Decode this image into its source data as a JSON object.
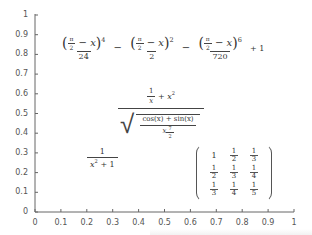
{
  "chart_data": {
    "type": "scatter",
    "title": "",
    "xlabel": "",
    "ylabel": "",
    "xlim": [
      0,
      1
    ],
    "ylim": [
      0,
      1
    ],
    "grid": false,
    "x_ticks": [
      "0",
      "0.1",
      "0.2",
      "0.3",
      "0.4",
      "0.5",
      "0.6",
      "0.7",
      "0.8",
      "0.9",
      "1"
    ],
    "y_ticks": [
      "0",
      "0.1",
      "0.2",
      "0.3",
      "0.4",
      "0.5",
      "0.6",
      "0.7",
      "0.8",
      "0.9",
      "1"
    ],
    "annotations": [
      {
        "id": "taylor_series",
        "text": "((π/2 − x)^4)/24 − ((π/2 − x)^2)/2 − ((π/2 − x)^6)/720 + 1",
        "x": 0.05,
        "y": 0.8
      },
      {
        "id": "sqrt_expression",
        "text": "(1/x + x^2) / sqrt((cos(x) + sin(x)) / x^(7/2))",
        "x": 0.45,
        "y": 0.55
      },
      {
        "id": "reciprocal",
        "text": "1/(x^2 + 1)",
        "x": 0.25,
        "y": 0.25
      },
      {
        "id": "hilbert_matrix",
        "text": "[[1, 1/2, 1/3], [1/2, 1/3, 1/4], [1/3, 1/4, 1/5]]",
        "x": 0.75,
        "y": 0.15
      }
    ]
  },
  "labels": {
    "taylor": {
      "pi": "π",
      "two": "2",
      "minus_x": "− x",
      "exp4": "4",
      "exp2": "2",
      "exp6": "6",
      "den1": "24",
      "den2": "2",
      "den3": "720",
      "op_minus": "−",
      "plus_one": "+ 1"
    },
    "sqrt_expr": {
      "one": "1",
      "x": "x",
      "plus_x2": "+ x",
      "sq": "2",
      "sqrt_sign": "√",
      "cos_sin": "cos(x) + sin(x)",
      "x_base": "x",
      "seven": "7",
      "two": "2"
    },
    "reciprocal": {
      "num": "1",
      "den_x": "x",
      "den_sq": "2",
      "den_plus": "+ 1"
    },
    "matrix": [
      [
        {
          "n": "1",
          "d": ""
        },
        {
          "n": "1",
          "d": "2"
        },
        {
          "n": "1",
          "d": "3"
        }
      ],
      [
        {
          "n": "1",
          "d": "2"
        },
        {
          "n": "1",
          "d": "3"
        },
        {
          "n": "1",
          "d": "4"
        }
      ],
      [
        {
          "n": "1",
          "d": "3"
        },
        {
          "n": "1",
          "d": "4"
        },
        {
          "n": "1",
          "d": "5"
        }
      ]
    ]
  },
  "colors": {
    "axis": "#666666",
    "text": "#333333",
    "background": "#ffffff"
  }
}
